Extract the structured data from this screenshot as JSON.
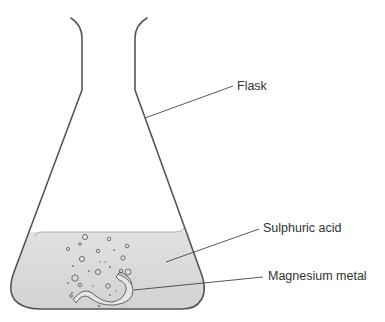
{
  "diagram": {
    "labels": {
      "flask": "Flask",
      "acid": "Sulphuric acid",
      "metal": "Magnesium metal"
    },
    "colors": {
      "outline": "#555555",
      "liquid": "#d9d9d9",
      "leader": "#444444",
      "text": "#333333"
    }
  }
}
